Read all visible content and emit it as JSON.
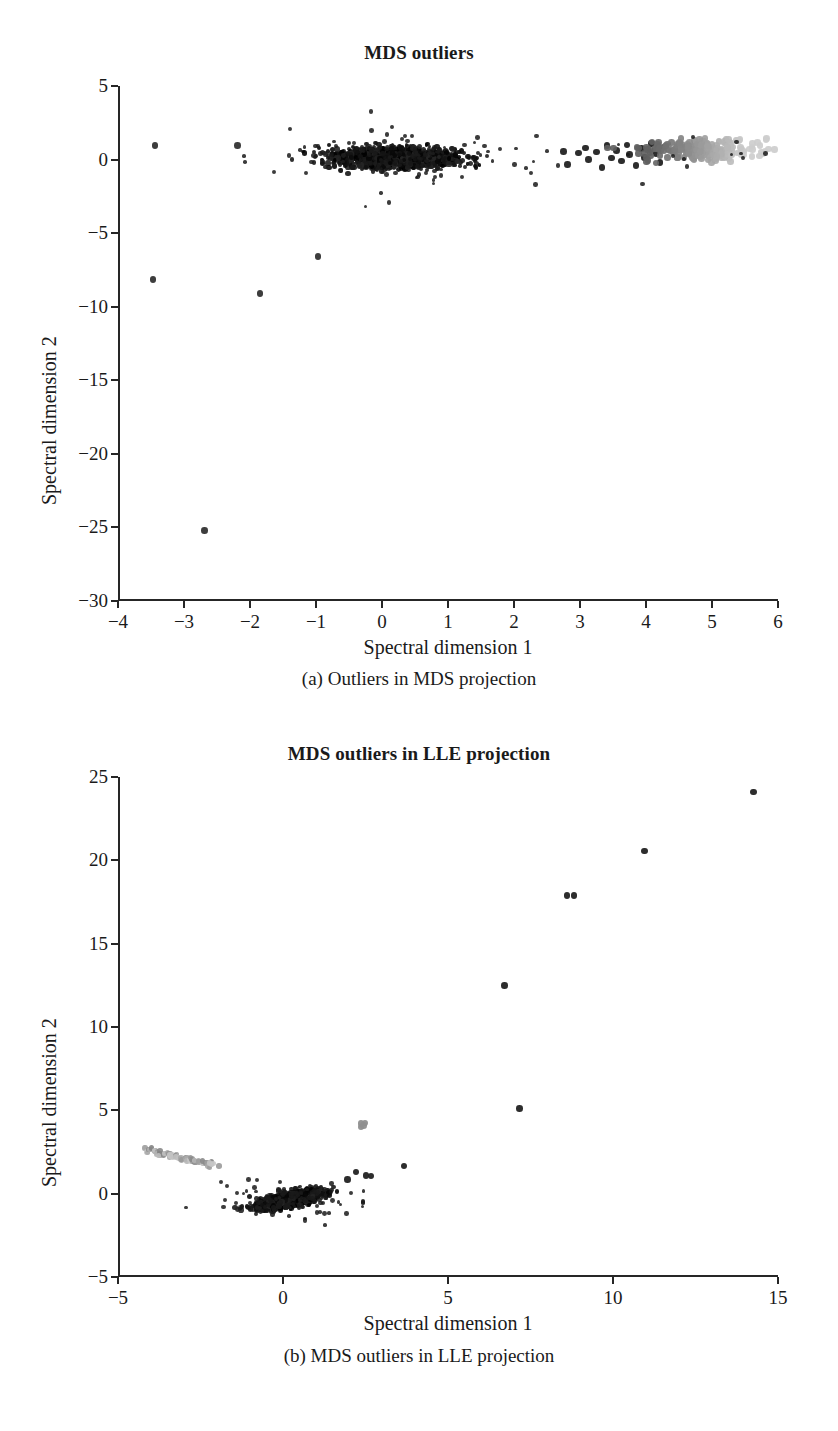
{
  "figure": {
    "panels": [
      {
        "id": "a",
        "title": "MDS outliers",
        "caption": "(a) Outliers in MDS projection",
        "xlabel": "Spectral dimension 1",
        "ylabel": "Spectral dimension 2",
        "xticks": [
          "-4",
          "-3",
          "-2",
          "-1",
          "0",
          "1",
          "2",
          "3",
          "4",
          "5",
          "6"
        ],
        "yticks": [
          "5",
          "0",
          "-5",
          "-10",
          "-15",
          "-20",
          "-25",
          "-30"
        ]
      },
      {
        "id": "b",
        "title": "MDS outliers in LLE projection",
        "caption": "(b) MDS outliers in LLE projection",
        "xlabel": "Spectral dimension 1",
        "ylabel": "Spectral dimension 2",
        "xticks": [
          "-5",
          "0",
          "5",
          "10",
          "15"
        ],
        "yticks": [
          "25",
          "20",
          "15",
          "10",
          "5",
          "0",
          "-5"
        ]
      }
    ]
  },
  "colors": {
    "axis": "#262626",
    "point_dark": "#111111",
    "point_mid": "#555555",
    "point_light": "#a8a8a8",
    "background": "#ffffff"
  },
  "chart_data": [
    {
      "type": "scatter",
      "title": "MDS outliers",
      "xlabel": "Spectral dimension 1",
      "ylabel": "Spectral dimension 2",
      "xlim": [
        -4,
        6
      ],
      "ylim": [
        -30,
        5
      ],
      "xticks": [
        -4,
        -3,
        -2,
        -1,
        0,
        1,
        2,
        3,
        4,
        5,
        6
      ],
      "yticks": [
        5,
        0,
        -5,
        -10,
        -15,
        -20,
        -25,
        -30
      ],
      "grid": false,
      "legend": "none",
      "series": [
        {
          "name": "main-dense-cluster",
          "color": "#111111",
          "description": "Large dense horizontal black cloud spanning x -1.3 to 1.8, y -2.2 to 1.5, centered near (0.1, 0.2)",
          "n_points": 1400,
          "cluster": {
            "x_center": 0.15,
            "y_center": 0.1,
            "x_spread": 0.85,
            "y_spread": 0.75
          }
        },
        {
          "name": "right-dark-group",
          "color": "#222222",
          "description": "Discrete dark points from x 2.7 to 4.2 near y 0 to 1.2",
          "points": [
            [
              2.72,
              0.55
            ],
            [
              2.78,
              -0.35
            ],
            [
              2.95,
              0.45
            ],
            [
              3.05,
              0.8
            ],
            [
              3.1,
              0.0
            ],
            [
              3.22,
              0.5
            ],
            [
              3.3,
              -0.55
            ],
            [
              3.38,
              0.95
            ],
            [
              3.45,
              0.1
            ],
            [
              3.52,
              0.6
            ],
            [
              3.6,
              -0.1
            ],
            [
              3.68,
              1.0
            ],
            [
              3.72,
              0.35
            ],
            [
              3.82,
              -0.4
            ],
            [
              3.9,
              0.75
            ],
            [
              3.95,
              0.15
            ],
            [
              4.05,
              1.1
            ],
            [
              4.12,
              0.4
            ],
            [
              4.18,
              -0.2
            ],
            [
              4.25,
              0.85
            ]
          ]
        },
        {
          "name": "right-gray-cluster",
          "color": "#a8a8a8",
          "description": "Gray band from x 3.9 to 5.65, y -0.4 to 1.6, progressively lighter toward the right edge",
          "n_points": 220,
          "cluster": {
            "x_center": 4.8,
            "y_center": 0.65,
            "x_spread": 0.8,
            "y_spread": 0.75
          }
        },
        {
          "name": "isolated-outliers",
          "color": "#333333",
          "description": "Far-field single outliers",
          "points": [
            [
              -3.47,
              0.95
            ],
            [
              -2.22,
              0.95
            ],
            [
              -3.5,
              -8.15
            ],
            [
              -1.88,
              -9.1
            ],
            [
              -2.72,
              -25.2
            ],
            [
              -1.0,
              -6.6
            ]
          ]
        }
      ]
    },
    {
      "type": "scatter",
      "title": "MDS outliers in LLE projection",
      "xlabel": "Spectral dimension 1",
      "ylabel": "Spectral dimension 2",
      "xlim": [
        -5,
        15
      ],
      "ylim": [
        -5,
        25
      ],
      "xticks": [
        -5,
        0,
        5,
        10,
        15
      ],
      "yticks": [
        25,
        20,
        15,
        10,
        5,
        0,
        -5
      ],
      "grid": false,
      "legend": "none",
      "series": [
        {
          "name": "left-gray-streak",
          "color": "#9c9c9c",
          "description": "Thin diagonal gray streak from (-4.2, 2.6) to (-2.2, 1.7)",
          "n_points": 70,
          "line": {
            "x0": -4.25,
            "y0": 2.65,
            "x1": -2.15,
            "y1": 1.7
          }
        },
        {
          "name": "main-dense-cluster",
          "color": "#111111",
          "description": "Dense elongated black cluster from (-1.1, -1.1) to (1.6, 0.5) centered near (0.1, -0.35)",
          "n_points": 1200,
          "cluster": {
            "x_center": 0.15,
            "y_center": -0.35,
            "x_spread": 0.9,
            "y_spread": 0.45
          }
        },
        {
          "name": "small-gray-cluster",
          "color": "#8f8f8f",
          "description": "Small gray blob near (2.35, 4.15)",
          "points": [
            [
              2.3,
              4.2
            ],
            [
              2.38,
              4.1
            ],
            [
              2.42,
              4.25
            ],
            [
              2.3,
              4.0
            ]
          ]
        },
        {
          "name": "scattered-outliers",
          "color": "#222222",
          "description": "Sparse isolated outliers extending up-right",
          "points": [
            [
              14.2,
              24.1
            ],
            [
              10.9,
              20.55
            ],
            [
              8.55,
              17.9
            ],
            [
              8.75,
              17.9
            ],
            [
              6.65,
              12.5
            ],
            [
              7.1,
              5.1
            ],
            [
              3.6,
              1.65
            ],
            [
              2.45,
              1.1
            ],
            [
              2.6,
              1.05
            ],
            [
              1.9,
              0.85
            ],
            [
              2.15,
              1.3
            ]
          ]
        }
      ]
    }
  ]
}
